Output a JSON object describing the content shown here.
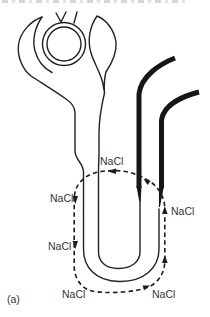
{
  "panel": {
    "label": "(a)"
  },
  "labels": {
    "top_center": "NaCl",
    "left_upper": "NaCl",
    "right": "NaCl",
    "left_lower": "NaCl",
    "bottom_left": "NaCl",
    "bottom_right": "NaCl"
  },
  "colors": {
    "line": "#222222",
    "thick_line": "#161616",
    "text": "#333333",
    "background": "#ffffff"
  }
}
